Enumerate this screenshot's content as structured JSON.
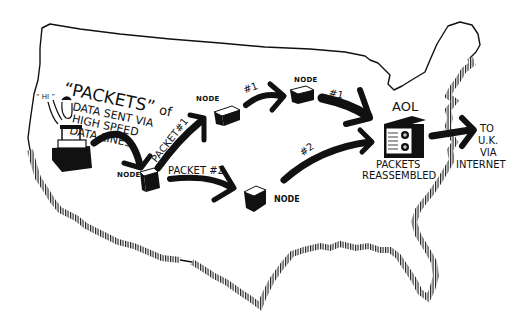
{
  "diagram": {
    "type": "packet-switching-map",
    "background_map": "united-states-outline",
    "colors": {
      "ink": "#111111",
      "paper": "#ffffff"
    },
    "intro_text": {
      "line1_quoted": "“PACKETS”",
      "line1_suffix": "of",
      "line2": "DATA SENT VIA",
      "line3": "HIGH SPEED",
      "line4": "DATA LINES"
    },
    "user": {
      "speech": "“ hi ”",
      "role": "computer-user"
    },
    "nodes": [
      {
        "id": "node-origin",
        "label": "NODE"
      },
      {
        "id": "node-upper-1",
        "label": "NODE"
      },
      {
        "id": "node-upper-2",
        "label": "NODE"
      },
      {
        "id": "node-lower",
        "label": "NODE"
      }
    ],
    "edges": [
      {
        "from": "user",
        "to": "node-origin",
        "label": ""
      },
      {
        "from": "node-origin",
        "to": "node-upper-1",
        "label": "PACKET#1"
      },
      {
        "from": "node-upper-1",
        "to": "node-upper-2",
        "label": "#1"
      },
      {
        "from": "node-upper-2",
        "to": "aol",
        "label": "#1"
      },
      {
        "from": "node-origin",
        "to": "node-lower",
        "label": "PACKET #2"
      },
      {
        "from": "node-lower",
        "to": "aol",
        "label": "#2"
      },
      {
        "from": "aol",
        "to": "uk",
        "label": ""
      }
    ],
    "aol": {
      "title": "AOL",
      "caption_line1": "PACKETS",
      "caption_line2": "REASSEMBLED"
    },
    "destination": {
      "line1": "TO",
      "line2": "U.K.",
      "line3": "VIA",
      "line4": "INTERNET"
    }
  }
}
